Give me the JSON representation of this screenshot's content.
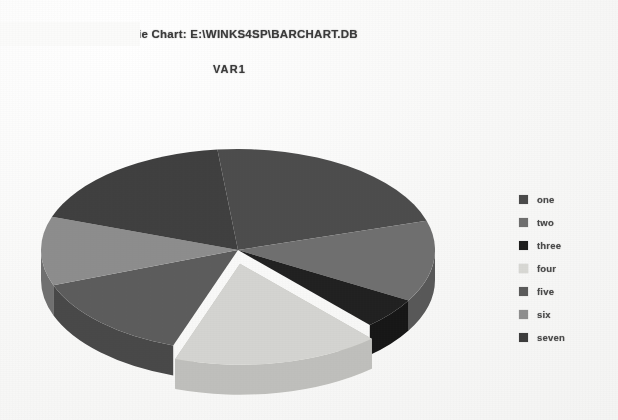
{
  "document": {
    "background_color": "#fbfbfa",
    "title": "ie Chart: E:\\WINKS4SP\\BARCHART.DB",
    "subtitle": "VAR1"
  },
  "legend": {
    "position": "right",
    "items": [
      {
        "label": "one",
        "color": "#4a4a4a"
      },
      {
        "label": "two",
        "color": "#6e6e6e"
      },
      {
        "label": "three",
        "color": "#1c1c1c"
      },
      {
        "label": "four",
        "color": "#d8d8d4"
      },
      {
        "label": "five",
        "color": "#5a5a5a"
      },
      {
        "label": "six",
        "color": "#8e8e8e"
      },
      {
        "label": "seven",
        "color": "#3c3c3c"
      }
    ]
  },
  "chart_data": {
    "type": "pie",
    "title": "ie Chart: E:\\WINKS4SP\\BARCHART.DB",
    "subtitle": "VAR1",
    "variable": "VAR1",
    "three_d": true,
    "exploded_slice": "four",
    "center": {
      "x": 238,
      "y": 250
    },
    "radius_x": 197,
    "radius_y": 101,
    "depth": 30,
    "categories": [
      "one",
      "two",
      "three",
      "four",
      "five",
      "six",
      "seven"
    ],
    "values": [
      22,
      13,
      5,
      17,
      14,
      11,
      18
    ],
    "start_angle": -96,
    "slice_colors": [
      "#4a4a4a",
      "#6e6e6e",
      "#1c1c1c",
      "#d8d8d4",
      "#5a5a5a",
      "#8e8e8e",
      "#3c3c3c"
    ],
    "side_colors": [
      "#3a3a3a",
      "#565656",
      "#121212",
      "#c2c2be",
      "#464646",
      "#6f6f6f",
      "#2e2e2e"
    ],
    "legend_position": "right",
    "grid": false,
    "xlabel": "",
    "ylabel": ""
  }
}
